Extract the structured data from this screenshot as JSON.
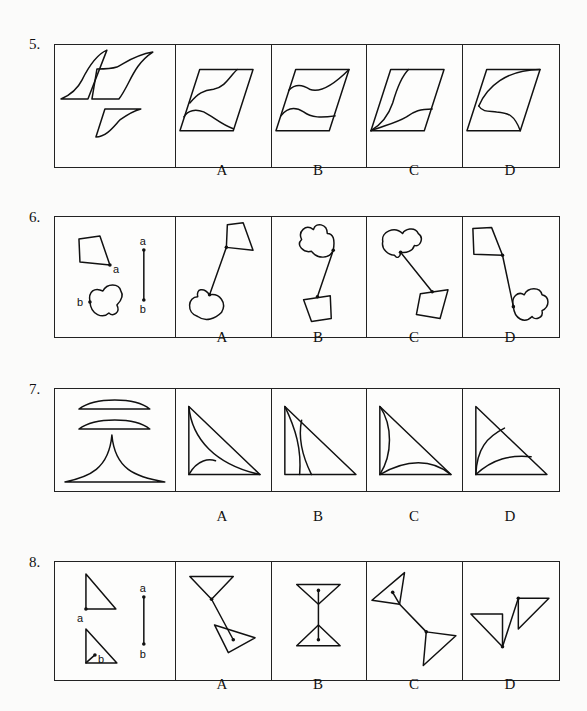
{
  "questions": [
    {
      "number": "5.",
      "options": [
        "A",
        "B",
        "C",
        "D"
      ],
      "stem_description": "Three curved parallelogram pieces",
      "option_descriptions": [
        "Parallelogram with two curves from left edge",
        "Parallelogram with two wavy curves",
        "Parallelogram with curves from bottom-left corner",
        "Parallelogram with curves from left edge to top-right and bottom"
      ]
    },
    {
      "number": "6.",
      "options": [
        "A",
        "B",
        "C",
        "D"
      ],
      "stem_description": "Quadrilateral with point a, cloud shape with point b, line segment a-b",
      "point_labels": {
        "a": "a",
        "b": "b"
      }
    },
    {
      "number": "7.",
      "options": [
        "A",
        "B",
        "C",
        "D"
      ],
      "stem_description": "Two lens segments and one concave cusp shape",
      "option_descriptions": [
        "Right triangle with two arcs",
        "Right triangle with two vertical arcs",
        "Right triangle with concave arcs from corners",
        "Right triangle with two arcs from bottom-left"
      ]
    },
    {
      "number": "8.",
      "options": [
        "A",
        "B",
        "C",
        "D"
      ],
      "stem_description": "Triangle with vertex a, triangle with interior point b, line segment a-b",
      "point_labels": {
        "a": "a",
        "b": "b"
      }
    }
  ]
}
